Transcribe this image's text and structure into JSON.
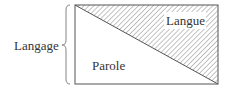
{
  "diagram": {
    "outer_label": "Langage",
    "upper_region_label": "Langue",
    "lower_region_label": "Parole",
    "colors": {
      "stroke": "#555555",
      "hatch": "#777777",
      "background": "#ffffff"
    }
  }
}
